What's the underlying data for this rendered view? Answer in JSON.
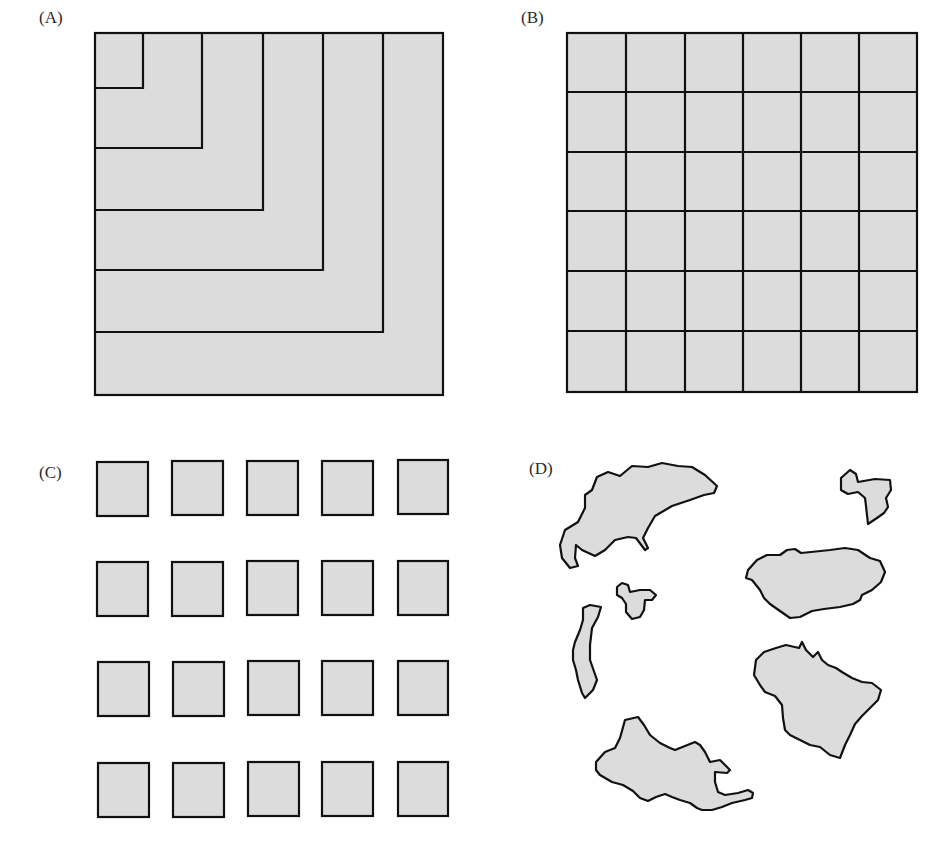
{
  "panels": {
    "a": {
      "label": "(A)",
      "description": "Nested L-shaped regions within a square"
    },
    "b": {
      "label": "(B)",
      "description": "Square divided into a 6x6 grid of equal cells"
    },
    "c": {
      "label": "(C)",
      "description": "20 separate equal squares in a 5x4 array"
    },
    "d": {
      "label": "(D)",
      "description": "Irregular fragmented patches"
    }
  },
  "colors": {
    "fill": "#dcdcdc",
    "stroke": "#111111"
  }
}
